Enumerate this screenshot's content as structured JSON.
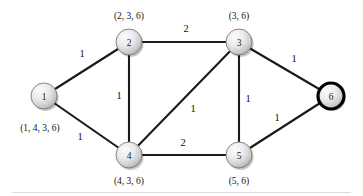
{
  "figure": {
    "background_color": "#ffffff",
    "edge_color": "#1a1a1a",
    "node_fill_light": "#f2f2f2",
    "node_fill_dark": "#a8a8a8",
    "highlight_color": "#000000"
  },
  "chart_data": {
    "type": "diagram",
    "diagram_kind": "weighted-undirected-graph",
    "title": "",
    "nodes": [
      {
        "id": "1",
        "label": "1",
        "x": 44,
        "y": 96,
        "r": 13,
        "caption": "(1, 4, 3, 6)",
        "caption_x": 40,
        "caption_y": 128,
        "highlighted": false
      },
      {
        "id": "2",
        "label": "2",
        "x": 129,
        "y": 42,
        "r": 13,
        "caption": "(2, 3, 6)",
        "caption_x": 129,
        "caption_y": 16,
        "highlighted": false
      },
      {
        "id": "3",
        "label": "3",
        "x": 239,
        "y": 42,
        "r": 13,
        "caption": "(3, 6)",
        "caption_x": 239,
        "caption_y": 16,
        "highlighted": false
      },
      {
        "id": "4",
        "label": "4",
        "x": 129,
        "y": 155,
        "r": 13,
        "caption": "(4, 3, 6)",
        "caption_x": 129,
        "caption_y": 181,
        "highlighted": false
      },
      {
        "id": "5",
        "label": "5",
        "x": 239,
        "y": 155,
        "r": 13,
        "caption": "(5, 6)",
        "caption_x": 239,
        "caption_y": 181,
        "highlighted": false
      },
      {
        "id": "6",
        "label": "6",
        "x": 331,
        "y": 96,
        "r": 13,
        "caption": "",
        "caption_x": 331,
        "caption_y": 128,
        "highlighted": true
      }
    ],
    "edges": [
      {
        "from": "1",
        "to": "2",
        "weight": "1",
        "label_x": 82,
        "label_y": 53
      },
      {
        "from": "1",
        "to": "4",
        "weight": "1",
        "label_x": 80,
        "label_y": 136
      },
      {
        "from": "2",
        "to": "3",
        "weight": "2",
        "label_x": 186,
        "label_y": 28
      },
      {
        "from": "2",
        "to": "4",
        "weight": "1",
        "label_x": 119,
        "label_y": 95
      },
      {
        "from": "3",
        "to": "4",
        "weight": "1",
        "label_x": 193,
        "label_y": 108
      },
      {
        "from": "3",
        "to": "5",
        "weight": "1",
        "label_x": 248,
        "label_y": 98
      },
      {
        "from": "3",
        "to": "6",
        "weight": "1",
        "label_x": 294,
        "label_y": 58
      },
      {
        "from": "4",
        "to": "5",
        "weight": "2",
        "label_x": 183,
        "label_y": 142
      },
      {
        "from": "5",
        "to": "6",
        "weight": "1",
        "label_x": 277,
        "label_y": 117
      }
    ],
    "node_captions": [
      "(1, 4, 3, 6)",
      "(2, 3, 6)",
      "(3, 6)",
      "(4, 3, 6)",
      "(5, 6)"
    ],
    "edge_weights": [
      "1",
      "1",
      "2",
      "1",
      "1",
      "1",
      "1",
      "2",
      "1"
    ],
    "highlighted_nodes": [
      "6"
    ]
  }
}
